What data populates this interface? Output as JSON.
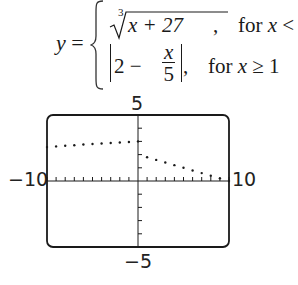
{
  "equation": {
    "lhs": "y",
    "equals": "=",
    "cases": [
      {
        "expr_radical_index": "3",
        "expr_radicand": "x + 27",
        "suffix": ",",
        "condition_prefix": "for",
        "condition_var": "x",
        "condition_rel": "< 1,",
        "condition": "for x < 1,"
      },
      {
        "expr_abs_left": "2 −",
        "expr_frac_num": "x",
        "expr_frac_den": "5",
        "suffix": ",",
        "condition_prefix": "for",
        "condition_var": "x",
        "condition_rel": "≥ 1",
        "condition": "for x ≥ 1"
      }
    ]
  },
  "graph": {
    "ymax_label": "5",
    "ymin_label": "−5",
    "xmin_label": "−10",
    "xmax_label": "10",
    "frame_color": "#1a1a1a"
  },
  "chart_data": {
    "type": "scatter",
    "xlabel": "",
    "ylabel": "",
    "xlim": [
      -10,
      10
    ],
    "ylim": [
      -5,
      5
    ],
    "xticks_step": 1,
    "yticks_step": 1,
    "grid": false,
    "legend": [],
    "series": [
      {
        "name": "cbrt(x+27), x<1",
        "x": [
          -10,
          -9,
          -8,
          -7,
          -6,
          -5,
          -4,
          -3,
          -2,
          -1,
          0
        ],
        "y": [
          2.57,
          2.62,
          2.67,
          2.71,
          2.76,
          2.8,
          2.84,
          2.88,
          2.92,
          2.96,
          3.0
        ]
      },
      {
        "name": "|2 - x/5|, x>=1",
        "x": [
          1,
          2,
          3,
          4,
          5,
          6,
          7,
          8,
          9,
          10
        ],
        "y": [
          1.8,
          1.6,
          1.4,
          1.2,
          1.0,
          0.8,
          0.6,
          0.4,
          0.2,
          0.0
        ]
      }
    ]
  }
}
